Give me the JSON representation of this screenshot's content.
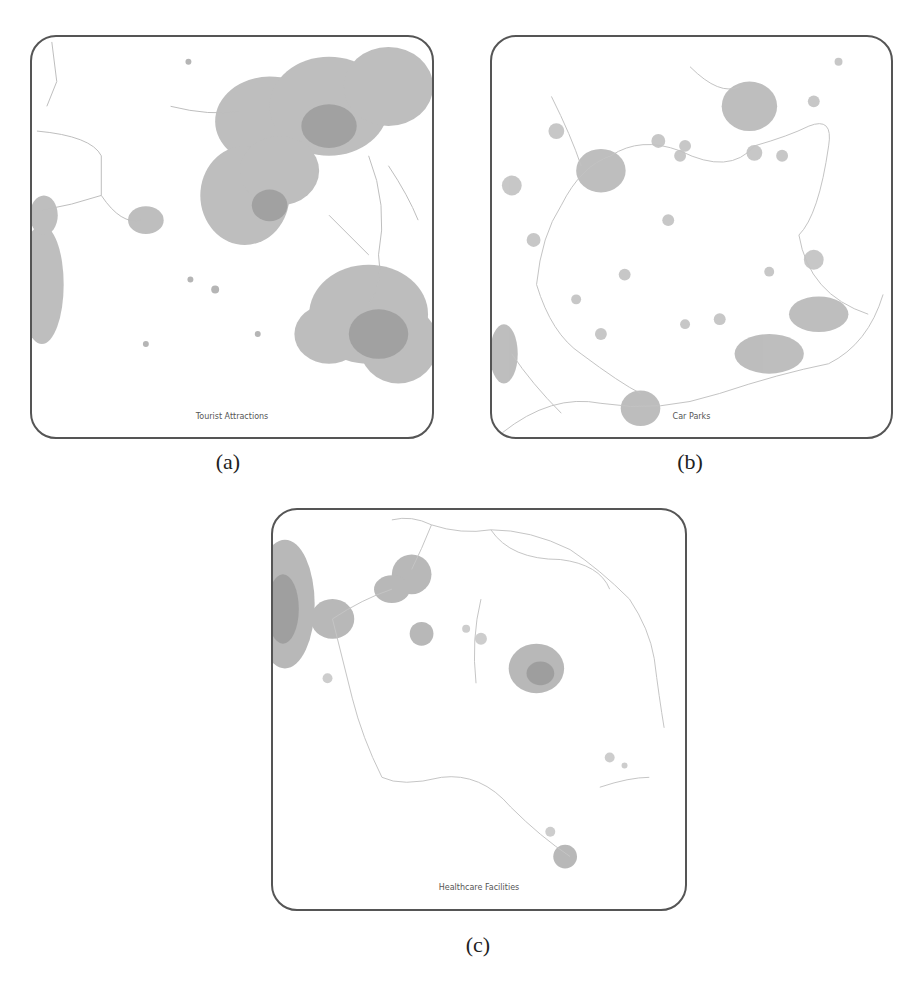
{
  "figure": {
    "panels": [
      {
        "id": "a",
        "map_label": "Tourist Attractions",
        "caption": "(a)",
        "description": "Large grey accessibility clusters in upper-centre/right and lower right; dendritic network on the left edge"
      },
      {
        "id": "b",
        "map_label": "Car Parks",
        "caption": "(b)",
        "description": "Scattered small clusters connected by thin road network; larger clusters upper right and upper left"
      },
      {
        "id": "c",
        "map_label": "Healthcare Facilities",
        "caption": "(c)",
        "description": "Dense cluster at left edge, medium cluster at centre right, small cluster lower right; sparse road network"
      }
    ]
  },
  "style": {
    "border_color": "#555555",
    "cluster_color": "#9a9a9a",
    "network_color": "#c0c0c0"
  }
}
